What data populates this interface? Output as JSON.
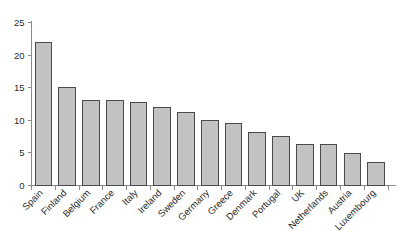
{
  "chart_data": {
    "type": "bar",
    "title": "",
    "subtitle": "",
    "xlabel": "",
    "ylabel": "",
    "ylim": [
      0,
      25
    ],
    "yticks": [
      0,
      5,
      10,
      15,
      20,
      25
    ],
    "ytick_labels": [
      "0",
      "5",
      "10",
      "15",
      "20",
      "25"
    ],
    "grid": false,
    "legend": false,
    "legend_position": "none",
    "xtick_rotation": 45,
    "bar_fill_color": "#c2c2c2",
    "bar_edge_color": "#4a4a4a",
    "background_color": "#ffffff",
    "axis_color": "#8a8a8a",
    "categories": [
      "Spain",
      "Finland",
      "Belgium",
      "France",
      "Italy",
      "Ireland",
      "Sweden",
      "Germany",
      "Greece",
      "Denmark",
      "Portugal",
      "UK",
      "Netherlands",
      "Austria",
      "Luxembourg"
    ],
    "values": [
      21.9,
      15.1,
      13.1,
      13.0,
      12.7,
      11.9,
      11.2,
      9.9,
      9.5,
      8.2,
      7.5,
      6.3,
      6.3,
      4.9,
      3.6
    ]
  }
}
